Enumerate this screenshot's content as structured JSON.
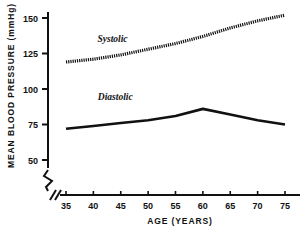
{
  "chart_data": {
    "type": "line",
    "title": "",
    "xlabel": "AGE (YEARS)",
    "ylabel": "MEAN BLOOD PRESSURE (mmHg)",
    "x": [
      35,
      40,
      45,
      50,
      55,
      60,
      65,
      70,
      75
    ],
    "xlim": [
      33,
      77
    ],
    "ylim": [
      45,
      158
    ],
    "xticks": [
      "35",
      "40",
      "45",
      "50",
      "55",
      "60",
      "65",
      "70",
      "75"
    ],
    "yticks": [
      "50",
      "75",
      "100",
      "125",
      "150"
    ],
    "grid": false,
    "legend_position": "inline-annotation",
    "axis_break_y": true,
    "axis_break_x": true,
    "series": [
      {
        "name": "Systolic",
        "style": "dotted",
        "color": "#111111",
        "values": [
          119,
          121,
          124,
          128,
          132,
          137,
          143,
          148,
          152
        ]
      },
      {
        "name": "Diastolic",
        "style": "solid",
        "color": "#111111",
        "values": [
          72,
          74,
          76,
          78,
          81,
          86,
          82,
          78,
          75
        ]
      }
    ],
    "annotations": [
      {
        "text": "Systolic",
        "x": 43.5,
        "y": 133
      },
      {
        "text": "Diastolic",
        "x": 44.0,
        "y": 92
      }
    ]
  }
}
